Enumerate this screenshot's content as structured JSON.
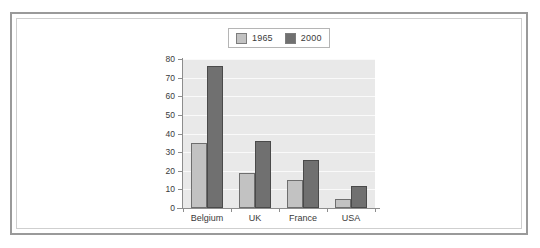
{
  "chart_data": {
    "type": "bar",
    "title": "",
    "xlabel": "",
    "ylabel": "",
    "categories": [
      "Belgium",
      "UK",
      "France",
      "USA"
    ],
    "series": [
      {
        "name": "1965",
        "values": [
          35,
          19,
          15,
          5
        ],
        "color": "#c2c2c2"
      },
      {
        "name": "2000",
        "values": [
          76,
          36,
          26,
          12
        ],
        "color": "#707070"
      }
    ],
    "ylim": [
      0,
      80
    ],
    "ytick_labels": [
      "0",
      "10",
      "20",
      "30",
      "40",
      "50",
      "60",
      "70",
      "80"
    ],
    "ytick_values": [
      0,
      10,
      20,
      30,
      40,
      50,
      60,
      70,
      80
    ],
    "grid": "horizontal",
    "legend_position": "top-center",
    "plot_background": "#e9e9e9",
    "gridline_color": "#fafafa"
  },
  "legend": {
    "entries": [
      {
        "label": "1965",
        "color": "#c2c2c2"
      },
      {
        "label": "2000",
        "color": "#707070"
      }
    ]
  }
}
